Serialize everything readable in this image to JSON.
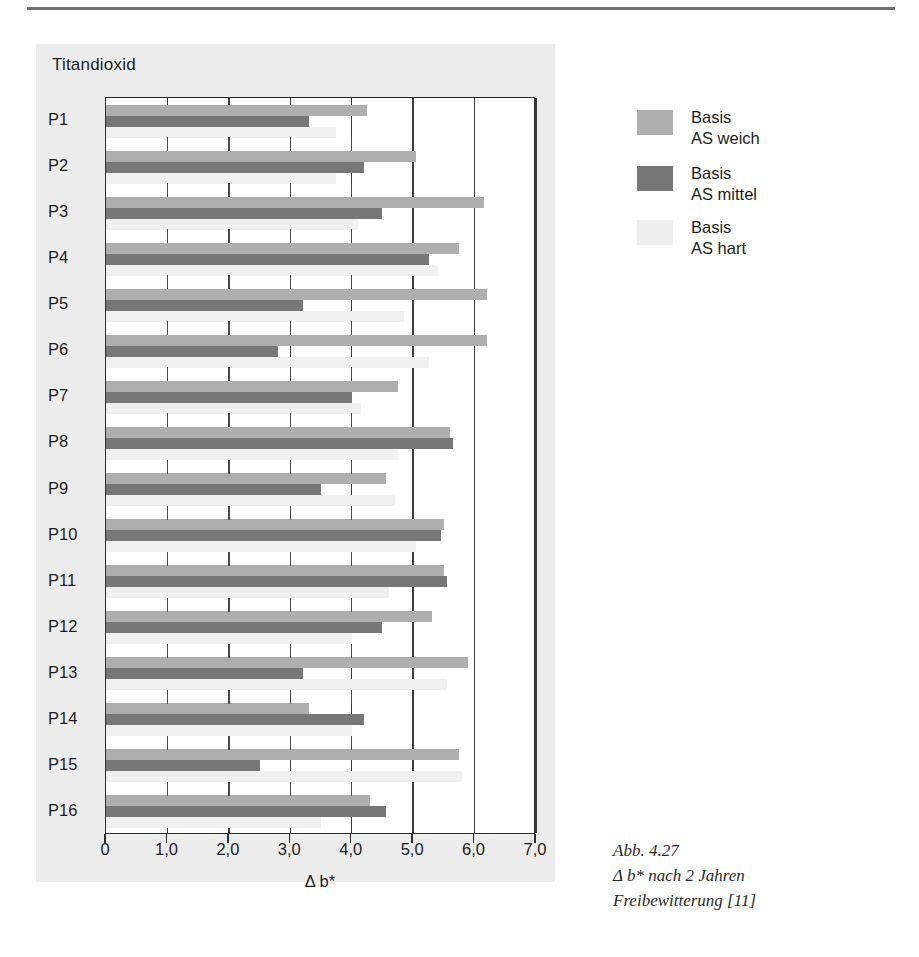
{
  "figure": {
    "panel_title": "Titandioxid",
    "caption_lines": [
      "Abb. 4.27",
      "Δ b* nach 2 Jahren",
      "Freibewitterung [11]"
    ],
    "colors": {
      "weich": "#aeaeae",
      "mittel": "#777777",
      "hart": "#f0f0f0",
      "panel_bg": "#ececec",
      "frame": "#2d2d2d"
    }
  },
  "legend": {
    "position": "right",
    "entries": [
      {
        "swatch": "weich",
        "line1": "Basis",
        "line2": "AS weich"
      },
      {
        "swatch": "mittel",
        "line1": "Basis",
        "line2": "AS mittel"
      },
      {
        "swatch": "hart",
        "line1": "Basis",
        "line2": "AS hart"
      }
    ]
  },
  "chart_data": {
    "type": "bar",
    "orientation": "horizontal",
    "title": "Titandioxid",
    "xlabel": "Δ b*",
    "ylabel": "",
    "xlim": [
      0,
      7.0
    ],
    "grid": true,
    "xticks": [
      0,
      1.0,
      2.0,
      3.0,
      4.0,
      5.0,
      6.0,
      7.0
    ],
    "xtick_labels": [
      "0",
      "1,0",
      "2,0",
      "3,0",
      "4,0",
      "5,0",
      "6,0",
      "7,0"
    ],
    "categories": [
      "P1",
      "P2",
      "P3",
      "P4",
      "P5",
      "P6",
      "P7",
      "P8",
      "P9",
      "P10",
      "P11",
      "P12",
      "P13",
      "P14",
      "P15",
      "P16"
    ],
    "series": [
      {
        "name": "Basis AS weich",
        "color": "#aeaeae",
        "values": [
          4.25,
          5.05,
          6.15,
          5.75,
          6.2,
          6.2,
          4.75,
          5.6,
          4.55,
          5.5,
          5.5,
          5.3,
          5.9,
          3.3,
          5.75,
          4.3
        ]
      },
      {
        "name": "Basis AS mittel",
        "color": "#777777",
        "values": [
          3.3,
          4.2,
          4.5,
          5.25,
          3.2,
          2.8,
          4.0,
          5.65,
          3.5,
          5.45,
          5.55,
          4.5,
          3.2,
          4.2,
          2.5,
          4.55
        ]
      },
      {
        "name": "Basis AS hart",
        "color": "#f0f0f0",
        "values": [
          3.75,
          3.75,
          4.1,
          5.4,
          4.85,
          5.25,
          4.15,
          4.75,
          4.7,
          5.05,
          4.6,
          4.0,
          5.55,
          4.0,
          5.8,
          3.5
        ]
      }
    ]
  }
}
